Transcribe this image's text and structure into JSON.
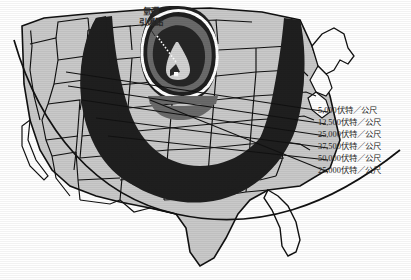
{
  "figure": {
    "type": "map",
    "annotation": {
      "line1": "氫彈",
      "line2": "引爆點"
    },
    "legend": [
      {
        "value": "5,000",
        "unit": "伏特／公尺",
        "label": "5,000伏特／公尺",
        "band": "outermost",
        "fill": "#c9c9c9"
      },
      {
        "value": "12,500",
        "unit": "伏特／公尺",
        "label": "12,500伏特／公尺",
        "band": "second",
        "fill": "#222222"
      },
      {
        "value": "25,000",
        "unit": "伏特／公尺",
        "label": "25,000伏特／公尺",
        "band": "third",
        "fill": "#ffffff"
      },
      {
        "value": "37,500",
        "unit": "伏特／公尺",
        "label": "37,500伏特／公尺",
        "band": "fourth",
        "fill": "#5f5f5f"
      },
      {
        "value": "50,000",
        "unit": "伏特／公尺",
        "label": "50,000伏特／公尺",
        "band": "fifth",
        "fill": "#222222"
      },
      {
        "value": "25,000",
        "unit": "伏特／公尺",
        "label": "25,000伏特／公尺",
        "band": "inner",
        "fill": "#cccccc"
      }
    ],
    "ground_zero_marker": "white-square",
    "colors": {
      "land": "#c9c9c9",
      "outline": "#111111",
      "dark_band": "#1f1f1f",
      "mid_band": "#6a6a6a",
      "light_band": "#d2d2d2",
      "white": "#ffffff",
      "paper": "#ffffff"
    }
  }
}
